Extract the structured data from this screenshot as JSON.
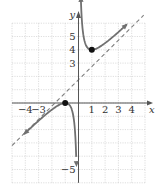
{
  "figure": {
    "x_axis_label": "x",
    "y_axis_label": "y",
    "x_tick_labels": [
      {
        "value": -4,
        "text": "−4"
      },
      {
        "value": -3,
        "text": "−3"
      },
      {
        "value": 1,
        "text": "1"
      },
      {
        "value": 2,
        "text": "2"
      },
      {
        "value": 3,
        "text": "3"
      },
      {
        "value": 4,
        "text": "4"
      }
    ],
    "y_tick_labels": [
      {
        "value": 5,
        "text": "5"
      },
      {
        "value": 4,
        "text": "4"
      },
      {
        "value": 3,
        "text": "3"
      },
      {
        "value": -5,
        "text": "−5"
      }
    ],
    "x_range": [
      -5,
      5
    ],
    "y_range": [
      -6,
      6
    ],
    "function": "y = x + 2 + 1/x",
    "oblique_asymptote": "y = x + 2",
    "vertical_asymptote": "x = 0",
    "marked_points": [
      {
        "x": 1,
        "y": 4,
        "label": "local minimum"
      },
      {
        "x": -1,
        "y": 0,
        "label": "local maximum"
      }
    ],
    "colors": {
      "curve": "#707070",
      "asymptote": "#808080",
      "grid": "#c8c8c8",
      "axis": "#555555",
      "point": "#111111"
    }
  }
}
